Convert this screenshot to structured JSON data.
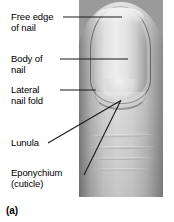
{
  "figure": {
    "panel_label": "(a)",
    "style": "grayscale photograph with leader-line labels"
  },
  "labels": [
    {
      "id": "free-edge",
      "text": "Free edge\nof nail",
      "leader": "horizontal"
    },
    {
      "id": "body",
      "text": "Body of\nnail",
      "leader": "horizontal"
    },
    {
      "id": "lateral",
      "text": "Lateral\nnail fold",
      "leader": "horizontal"
    },
    {
      "id": "lunula",
      "text": "Lunula",
      "leader": "diagonal"
    },
    {
      "id": "eponychium",
      "text": "Eponychium\n(cuticle)",
      "leader": "diagonal"
    }
  ],
  "colors": {
    "background": "#ffffff",
    "text": "#000000",
    "leader_line": "#1a1a1a",
    "skin_mid": "#c8c8c8",
    "skin_shadow": "#7e7e7e",
    "nail_plate": "#e6e6e6",
    "nail_outline": "#2b2b2b",
    "lunula": "#f0f0f0"
  }
}
